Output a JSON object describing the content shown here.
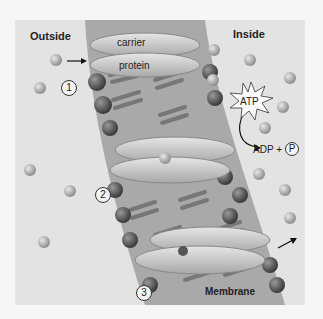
{
  "diagram": {
    "labels": {
      "outside": "Outside",
      "inside": "Inside",
      "carrier": "carrier",
      "protein": "protein",
      "membrane": "Membrane",
      "atp": "ATP",
      "adp": "ADP +",
      "phosphate": "P"
    },
    "steps": [
      {
        "number": "1"
      },
      {
        "number": "2"
      },
      {
        "number": "3"
      }
    ],
    "colors": {
      "background": "#e3e3e3",
      "membrane": "#a9a9a9",
      "protein": "#cfcfcf",
      "phospholipid_head": "#555555",
      "solute": "#b0b0b0"
    }
  }
}
